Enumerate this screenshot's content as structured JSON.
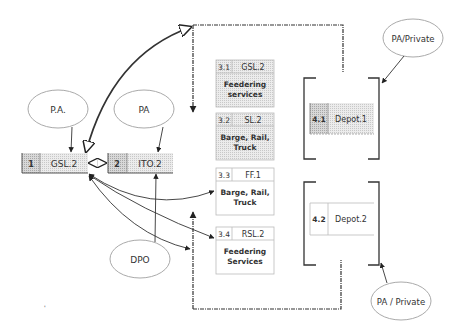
{
  "diagram": {
    "ellipses": {
      "pa_dot": "P.A.",
      "pa": "PA",
      "pa_private_top": "PA/Private",
      "dpo": "DPO",
      "pa_private_bottom": "PA / Private"
    },
    "nodes": {
      "n1": {
        "id": "1",
        "label": "GSL.2"
      },
      "n2": {
        "id": "2",
        "label": "ITO.2"
      },
      "n31": {
        "id": "3.1",
        "label": "GSL.2",
        "desc1": "Feedering",
        "desc2": "services"
      },
      "n32": {
        "id": "3.2",
        "label": "SL.2",
        "desc1": "Barge, Rail,",
        "desc2": "Truck"
      },
      "n33": {
        "id": "3.3",
        "label": "FF.1",
        "desc1": "Barge, Rail,",
        "desc2": "Truck"
      },
      "n34": {
        "id": "3.4",
        "label": "RSL.2",
        "desc1": "Feedering",
        "desc2": "Services"
      },
      "n41": {
        "id": "4.1",
        "label": "Depot.1"
      },
      "n42": {
        "id": "4.2",
        "label": "Depot.2"
      }
    },
    "colors": {
      "line": "#333333",
      "shade": "#e2e2e2",
      "shade_dark": "#cfcfcf",
      "ellipse_stroke": "#aaaaaa"
    }
  }
}
